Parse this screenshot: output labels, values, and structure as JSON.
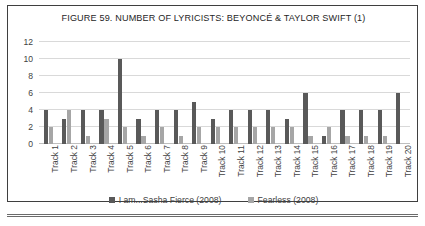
{
  "figure": {
    "title": "FIGURE 59. NUMBER OF LYRICISTS: BEYONCÉ & TAYLOR SWIFT (1)"
  },
  "legend": {
    "position": "bottom-center",
    "items": [
      {
        "label": "I am...Sasha Fierce (2008)",
        "color": "#595959",
        "swatch_name": "legend-swatch-sasha-fierce"
      },
      {
        "label": "Fearless (2008)",
        "color": "#a6a6a6",
        "swatch_name": "legend-swatch-fearless"
      }
    ]
  },
  "chart_data": {
    "type": "bar",
    "title": "FIGURE 59. NUMBER OF LYRICISTS: BEYONCÉ & TAYLOR SWIFT (1)",
    "xlabel": "",
    "ylabel": "",
    "ylim": [
      0,
      12
    ],
    "yticks": [
      0,
      2,
      4,
      6,
      8,
      10,
      12
    ],
    "grid": true,
    "legend_position": "bottom",
    "categories": [
      "Track 1",
      "Track 2",
      "Track 3",
      "Track 4",
      "Track 5",
      "Track 6",
      "Track 7",
      "Track 8",
      "Track 9",
      "Track 10",
      "Track 11",
      "Track 12",
      "Track 13",
      "Track 14",
      "Track 15",
      "Track 16",
      "Track 17",
      "Track 18",
      "Track 19",
      "Track 20"
    ],
    "series": [
      {
        "name": "I am...Sasha Fierce (2008)",
        "color": "#595959",
        "values": [
          4,
          3,
          4,
          4,
          10,
          3,
          4,
          4,
          5,
          3,
          4,
          4,
          4,
          3,
          6,
          1,
          4,
          4,
          4,
          6
        ]
      },
      {
        "name": "Fearless (2008)",
        "color": "#a6a6a6",
        "values": [
          2,
          4,
          1,
          3,
          2,
          1,
          2,
          1,
          2,
          2,
          2,
          2,
          2,
          2,
          1,
          2,
          1,
          1,
          1,
          0
        ]
      }
    ]
  }
}
